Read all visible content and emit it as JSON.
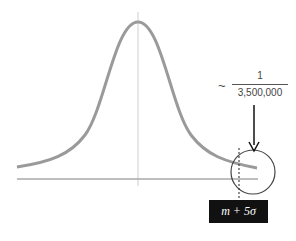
{
  "diagram": {
    "annotation": {
      "approx_symbol": "~",
      "numerator": "1",
      "denominator": "3,500,000"
    },
    "threshold_label": "m + 5σ",
    "colors": {
      "curve": "#9a9a9a",
      "axis": "#a8a8a8",
      "center_line": "#cccccc",
      "circle": "#444444",
      "arrow": "#111111",
      "label_bg": "#111111",
      "label_text": "#ffffff"
    }
  }
}
